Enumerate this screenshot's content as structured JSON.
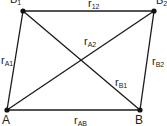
{
  "diagram": {
    "points": [
      {
        "id": "B1",
        "label": "B",
        "sub": "1",
        "x": 23,
        "y": 11
      },
      {
        "id": "B2",
        "label": "B",
        "sub": "2",
        "x": 154,
        "y": 11
      },
      {
        "id": "A",
        "label": "A",
        "sub": "",
        "x": 7,
        "y": 110
      },
      {
        "id": "B",
        "label": "B",
        "sub": "",
        "x": 140,
        "y": 110
      }
    ],
    "edges": [
      {
        "from": "B1",
        "to": "B2",
        "label": "r",
        "sub": "12"
      },
      {
        "from": "A",
        "to": "B1",
        "label": "r",
        "sub": "A1"
      },
      {
        "from": "A",
        "to": "B2",
        "label": "r",
        "sub": "A2"
      },
      {
        "from": "B",
        "to": "B1",
        "label": "r",
        "sub": "B1"
      },
      {
        "from": "B",
        "to": "B2",
        "label": "r",
        "sub": "B2"
      },
      {
        "from": "A",
        "to": "B",
        "label": "r",
        "sub": "AB"
      }
    ],
    "colors": {
      "line": "#1a1a1a",
      "text": "#222222"
    }
  }
}
